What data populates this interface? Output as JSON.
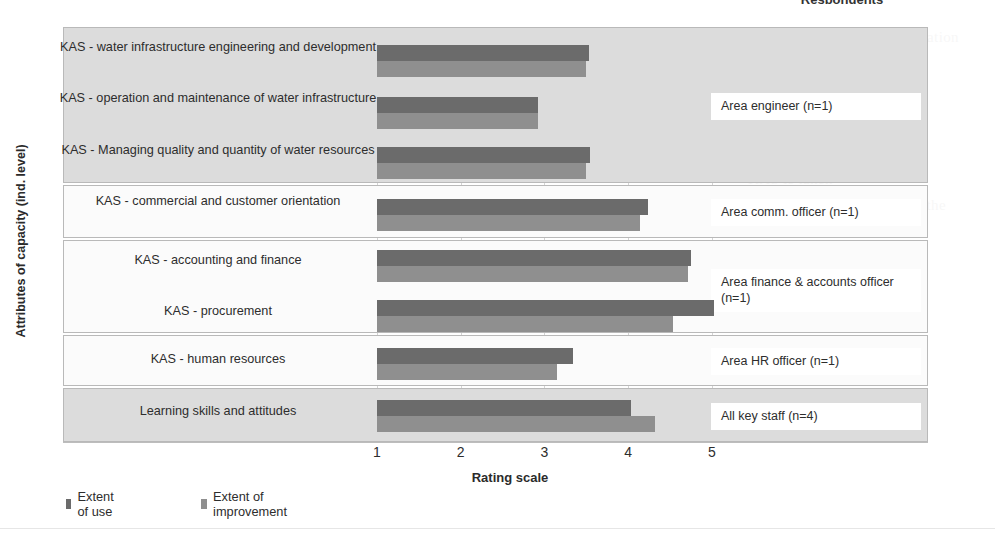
{
  "chart_data": {
    "type": "bar",
    "orientation": "horizontal",
    "title": "Respondents",
    "xlabel": "Rating scale",
    "ylabel": "Attributes of capacity (ind. level)",
    "xlim": [
      1,
      5.4
    ],
    "xticks": [
      1,
      2,
      3,
      4,
      5
    ],
    "grid": true,
    "legend_position": "bottom-left",
    "categories": [
      "KAS - water infrastructure engineering and development",
      "KAS - operation and maintenance of water infrastructure",
      "KAS - Managing quality and quantity of water resources",
      "KAS - commercial and customer orientation",
      "KAS - accounting and finance",
      "KAS - procurement",
      "KAS - human resources",
      "Learning skills and attitudes"
    ],
    "series": [
      {
        "name": "Extent of use",
        "color": "#6b6b6b",
        "values": [
          3.53,
          2.92,
          3.54,
          4.24,
          4.75,
          5.03,
          3.34,
          4.04
        ]
      },
      {
        "name": "Extent of improvement",
        "color": "#8f8f8f",
        "values": [
          3.5,
          2.92,
          3.5,
          4.14,
          4.72,
          4.54,
          3.15,
          4.32
        ]
      }
    ],
    "groups": [
      {
        "label": "Area engineer (n=1)",
        "categories": 3,
        "shaded": true
      },
      {
        "label": "Area comm. officer (n=1)",
        "categories": 1,
        "shaded": false
      },
      {
        "label": "Area finance & accounts officer (n=1)",
        "categories": 2,
        "shaded": false
      },
      {
        "label": "Area HR officer (n=1)",
        "categories": 1,
        "shaded": false
      },
      {
        "label": "All key staff (n=4)",
        "categories": 1,
        "shaded": true
      }
    ]
  },
  "chart": {
    "top_title": "Respondents",
    "y_axis_title": "Attributes of capacity (ind. level)",
    "x_axis_title": "Rating scale",
    "x_tick_labels": [
      "1",
      "2",
      "3",
      "4",
      "5"
    ],
    "category_labels": [
      "KAS - water infrastructure engineering and development",
      "KAS - operation and maintenance of water infrastructure",
      "KAS - Managing quality and quantity of water resources",
      "KAS - commercial and customer orientation",
      "KAS - accounting and finance",
      "KAS - procurement",
      "KAS - human resources",
      "Learning skills and attitudes"
    ],
    "group_labels": [
      "Area engineer (n=1)",
      "Area comm. officer (n=1)",
      "Area finance & accounts officer (n=1)",
      "Area HR officer (n=1)",
      "All key staff (n=4)"
    ],
    "legend": [
      {
        "label": "Extent of use",
        "color": "#6b6b6b"
      },
      {
        "label": "Extent of improvement",
        "color": "#8f8f8f"
      }
    ],
    "colors": {
      "extent_of_use": "#6b6b6b",
      "extent_of_improvement": "#8f8f8f",
      "group_shaded": "#dcdcdc",
      "group_plain": "#fbfbfb",
      "grid": "#d4d4d4"
    }
  },
  "background_bleed": [
    "and language and communication",
    "level",
    "2. Individual level",
    "and needed for",
    "KAS is taken",
    "are in Appendix 3. Result of the",
    "in the",
    "Figure"
  ]
}
